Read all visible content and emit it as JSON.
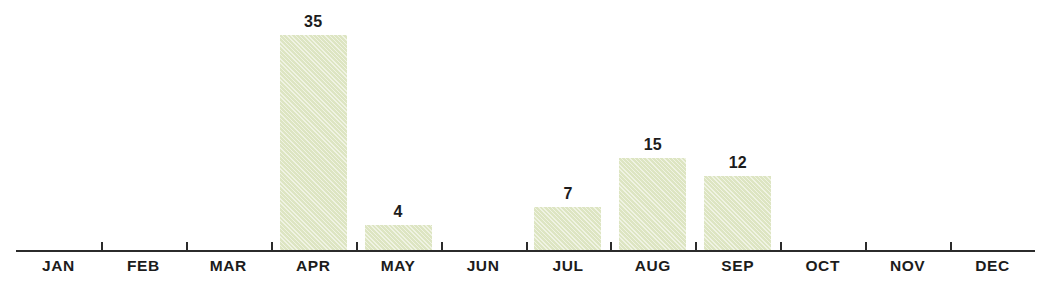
{
  "chart_data": {
    "type": "bar",
    "title": "",
    "subtitle": "",
    "xlabel": "",
    "ylabel": "",
    "categories": [
      "JAN",
      "FEB",
      "MAR",
      "APR",
      "MAY",
      "JUN",
      "JUL",
      "AUG",
      "SEP",
      "OCT",
      "NOV",
      "DEC"
    ],
    "values": [
      0,
      0,
      0,
      35,
      4,
      0,
      7,
      15,
      12,
      0,
      0,
      0
    ],
    "value_labels": [
      "",
      "",
      "",
      "35",
      "4",
      "",
      "7",
      "15",
      "12",
      "",
      "",
      ""
    ],
    "ylim": [
      0,
      35
    ],
    "grid": false,
    "legend": null,
    "bar_color": "#dde5c2",
    "axis_color": "#2b2b2b",
    "text_color": "#1c1c1c",
    "background": "#ffffff",
    "annotations": []
  },
  "axis": {
    "tick_count": 11,
    "baseline_y": 250
  }
}
